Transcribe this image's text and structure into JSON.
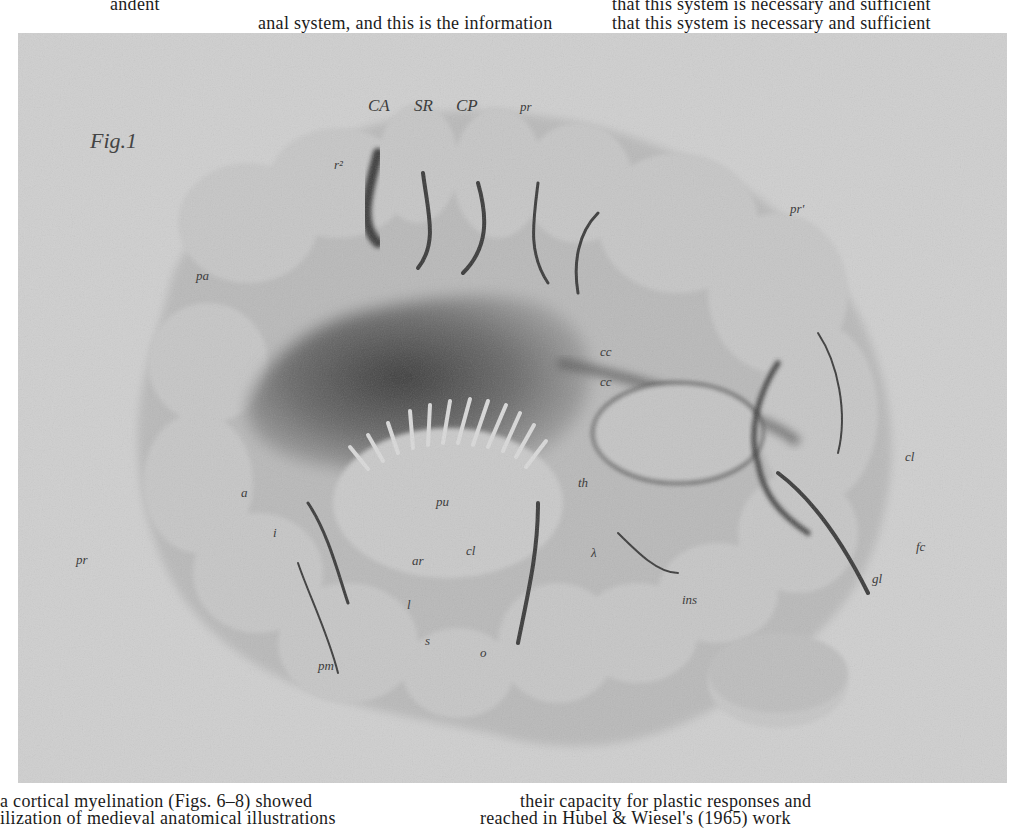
{
  "page": {
    "top_text": [
      {
        "text": "andent",
        "x": 110,
        "y": -6
      },
      {
        "text": "that this system is necessary and sufficient",
        "x": 612,
        "y": -6
      },
      {
        "text": "anal system, and this is the information",
        "x": 258,
        "y": 13
      },
      {
        "text": "that this system is necessary and sufficient",
        "x": 612,
        "y": 13
      }
    ],
    "bottom_text": [
      {
        "text": "a cortical myelination (Figs. 6–8) showed",
        "x": 0,
        "y": 791
      },
      {
        "text": "their capacity for plastic responses and",
        "x": 520,
        "y": 791
      },
      {
        "text": "ilization of medieval anatomical illustrations",
        "x": 0,
        "y": 808
      },
      {
        "text": "reached in Hubel & Wiesel's (1965) work",
        "x": 480,
        "y": 808
      }
    ]
  },
  "figure": {
    "title": "Fig.1",
    "background_color": "#cfcfcf",
    "labels": [
      {
        "id": "CA",
        "text": "CA",
        "x": 368,
        "y": 97,
        "style": "caps"
      },
      {
        "id": "SR",
        "text": "SR",
        "x": 414,
        "y": 97,
        "style": "caps"
      },
      {
        "id": "CP",
        "text": "CP",
        "x": 456,
        "y": 97,
        "style": "caps"
      },
      {
        "id": "pr",
        "text": "pr",
        "x": 520,
        "y": 100,
        "style": ""
      },
      {
        "id": "pr-prime",
        "text": "pr'",
        "x": 790,
        "y": 202,
        "style": ""
      },
      {
        "id": "r2",
        "text": "r²",
        "x": 334,
        "y": 158,
        "style": ""
      },
      {
        "id": "pa",
        "text": "pa",
        "x": 196,
        "y": 269,
        "style": ""
      },
      {
        "id": "cc-1",
        "text": "cc",
        "x": 600,
        "y": 345,
        "style": ""
      },
      {
        "id": "cc-2",
        "text": "cc",
        "x": 600,
        "y": 375,
        "style": ""
      },
      {
        "id": "cl",
        "text": "cl",
        "x": 905,
        "y": 450,
        "style": ""
      },
      {
        "id": "a",
        "text": "a",
        "x": 241,
        "y": 486,
        "style": ""
      },
      {
        "id": "pu",
        "text": "pu",
        "x": 436,
        "y": 495,
        "style": ""
      },
      {
        "id": "th",
        "text": "th",
        "x": 578,
        "y": 476,
        "style": ""
      },
      {
        "id": "i",
        "text": "i",
        "x": 273,
        "y": 526,
        "style": ""
      },
      {
        "id": "pr-left",
        "text": "pr",
        "x": 76,
        "y": 553,
        "style": ""
      },
      {
        "id": "ar",
        "text": "ar",
        "x": 412,
        "y": 554,
        "style": ""
      },
      {
        "id": "cl-2",
        "text": "cl",
        "x": 466,
        "y": 544,
        "style": ""
      },
      {
        "id": "lambda",
        "text": "λ",
        "x": 591,
        "y": 546,
        "style": ""
      },
      {
        "id": "fc",
        "text": "fc",
        "x": 916,
        "y": 540,
        "style": ""
      },
      {
        "id": "gl",
        "text": "gl",
        "x": 872,
        "y": 572,
        "style": ""
      },
      {
        "id": "l",
        "text": "l",
        "x": 407,
        "y": 598,
        "style": ""
      },
      {
        "id": "ins",
        "text": "ins",
        "x": 682,
        "y": 593,
        "style": ""
      },
      {
        "id": "s",
        "text": "s",
        "x": 425,
        "y": 634,
        "style": ""
      },
      {
        "id": "o",
        "text": "o",
        "x": 480,
        "y": 646,
        "style": ""
      },
      {
        "id": "pm",
        "text": "pm",
        "x": 318,
        "y": 659,
        "style": ""
      }
    ]
  }
}
